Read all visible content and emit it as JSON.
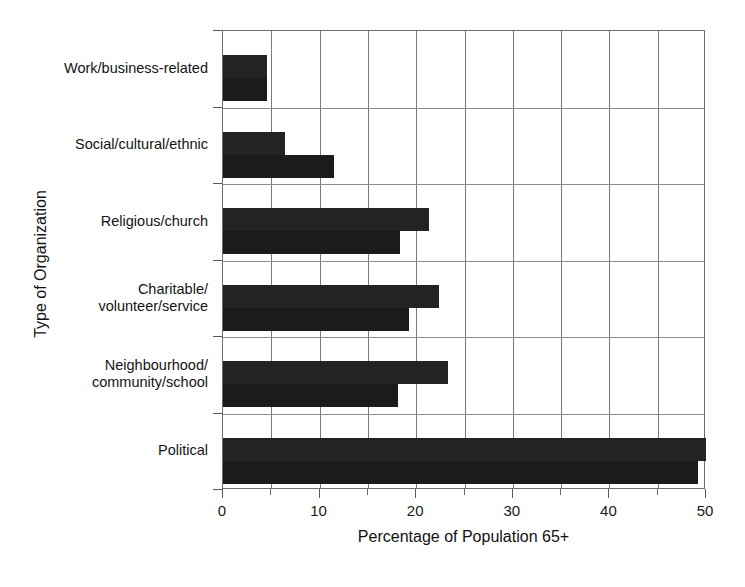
{
  "chart_data": {
    "type": "bar",
    "orientation": "horizontal",
    "title": "",
    "xlabel": "Percentage of Population 65+",
    "ylabel": "Type of Organization",
    "xlim": [
      0,
      50
    ],
    "xticks": [
      0,
      10,
      20,
      30,
      40,
      50
    ],
    "xtick_labels": [
      "0",
      "10",
      "20",
      "30",
      "40",
      "50"
    ],
    "minor_xticks": [
      5,
      15,
      25,
      35,
      45
    ],
    "grid": "vertical-and-category-separators",
    "legend": "none",
    "bar_color": "#1c1c1c",
    "categories": [
      "Work/business-related",
      "Social/cultural/ethnic",
      "Religious/church",
      "Charitable/\nvolunteer/service",
      "Neighbourhood/\ncommunity/school",
      "Political"
    ],
    "series": [
      {
        "name": "upper",
        "values": [
          4.6,
          6.4,
          21.3,
          22.4,
          23.3,
          50.0
        ]
      },
      {
        "name": "lower",
        "values": [
          4.6,
          11.5,
          18.3,
          19.3,
          18.1,
          49.2
        ]
      }
    ]
  },
  "axis": {
    "x_title": "Percentage of Population 65+",
    "y_title": "Type of Organization"
  }
}
